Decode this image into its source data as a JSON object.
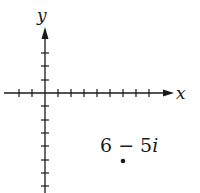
{
  "diagram": {
    "type": "complex-plane",
    "axes": {
      "x_label": "x",
      "y_label": "y",
      "x_ticks_left": 2,
      "x_ticks_right": 9,
      "y_ticks_up": 3,
      "y_ticks_down": 7
    },
    "point": {
      "label": "6 − 5i",
      "label_real": "6 − 5",
      "label_imag_unit": "i",
      "x": 6,
      "y": -5
    },
    "colors": {
      "ink": "#1a1a1a",
      "background": "#ffffff"
    }
  }
}
